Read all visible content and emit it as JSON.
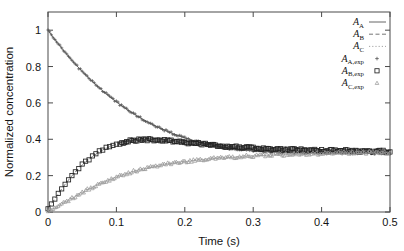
{
  "chart_data": {
    "type": "line",
    "title": "",
    "xlabel": "Time (s)",
    "ylabel": "Normalized concentration",
    "xlim": [
      0,
      0.5
    ],
    "ylim": [
      0,
      1.1
    ],
    "xticks": [
      "0",
      "0.1",
      "0.2",
      "0.3",
      "0.4",
      "0.5"
    ],
    "xtick_values": [
      0,
      0.1,
      0.2,
      0.3,
      0.4,
      0.5
    ],
    "yticks": [
      "0",
      "0.2",
      "0.4",
      "0.6",
      "0.8",
      "1"
    ],
    "ytick_values": [
      0,
      0.2,
      0.4,
      0.6,
      0.8,
      1.0
    ],
    "grid": false,
    "legend_position": "top-right",
    "x": [
      0.0,
      0.005,
      0.01,
      0.015,
      0.02,
      0.025,
      0.03,
      0.035,
      0.04,
      0.045,
      0.05,
      0.055,
      0.06,
      0.065,
      0.07,
      0.075,
      0.08,
      0.085,
      0.09,
      0.095,
      0.1,
      0.105,
      0.11,
      0.115,
      0.12,
      0.125,
      0.13,
      0.135,
      0.14,
      0.145,
      0.15,
      0.155,
      0.16,
      0.165,
      0.17,
      0.175,
      0.18,
      0.185,
      0.19,
      0.195,
      0.2,
      0.205,
      0.21,
      0.215,
      0.22,
      0.225,
      0.23,
      0.235,
      0.24,
      0.245,
      0.25,
      0.255,
      0.26,
      0.265,
      0.27,
      0.275,
      0.28,
      0.285,
      0.29,
      0.295,
      0.3,
      0.305,
      0.31,
      0.315,
      0.32,
      0.325,
      0.33,
      0.335,
      0.34,
      0.345,
      0.35,
      0.355,
      0.36,
      0.365,
      0.37,
      0.375,
      0.38,
      0.385,
      0.39,
      0.395,
      0.4,
      0.405,
      0.41,
      0.415,
      0.42,
      0.425,
      0.43,
      0.435,
      0.44,
      0.445,
      0.45,
      0.455,
      0.46,
      0.465,
      0.47,
      0.475,
      0.48,
      0.485,
      0.49,
      0.495,
      0.5
    ],
    "series": [
      {
        "name": "A_A",
        "label": "A",
        "subscript": "A",
        "style": "solid",
        "marker": "none",
        "color": "#555555",
        "values": [
          1.0,
          0.974,
          0.949,
          0.925,
          0.901,
          0.878,
          0.856,
          0.834,
          0.813,
          0.793,
          0.773,
          0.754,
          0.735,
          0.717,
          0.7,
          0.683,
          0.666,
          0.65,
          0.635,
          0.62,
          0.606,
          0.592,
          0.578,
          0.565,
          0.553,
          0.541,
          0.529,
          0.518,
          0.507,
          0.497,
          0.487,
          0.477,
          0.468,
          0.459,
          0.451,
          0.443,
          0.435,
          0.428,
          0.421,
          0.414,
          0.408,
          0.402,
          0.396,
          0.391,
          0.386,
          0.381,
          0.376,
          0.372,
          0.368,
          0.364,
          0.36,
          0.357,
          0.354,
          0.351,
          0.348,
          0.346,
          0.344,
          0.342,
          0.34,
          0.338,
          0.336,
          0.335,
          0.334,
          0.333,
          0.332,
          0.331,
          0.33,
          0.329,
          0.328,
          0.328,
          0.327,
          0.327,
          0.326,
          0.326,
          0.326,
          0.325,
          0.325,
          0.325,
          0.325,
          0.325,
          0.325,
          0.325,
          0.324,
          0.324,
          0.324,
          0.324,
          0.324,
          0.324,
          0.324,
          0.324,
          0.324,
          0.324,
          0.324,
          0.324,
          0.324,
          0.324,
          0.324,
          0.324,
          0.324,
          0.324,
          0.324
        ]
      },
      {
        "name": "A_B",
        "label": "A",
        "subscript": "B",
        "style": "dashed",
        "marker": "none",
        "color": "#666666",
        "values": [
          0.02,
          0.045,
          0.072,
          0.1,
          0.127,
          0.152,
          0.176,
          0.199,
          0.22,
          0.24,
          0.258,
          0.275,
          0.291,
          0.305,
          0.318,
          0.33,
          0.341,
          0.35,
          0.359,
          0.366,
          0.373,
          0.379,
          0.384,
          0.388,
          0.391,
          0.394,
          0.396,
          0.397,
          0.398,
          0.399,
          0.399,
          0.398,
          0.397,
          0.396,
          0.395,
          0.393,
          0.391,
          0.389,
          0.387,
          0.385,
          0.383,
          0.381,
          0.379,
          0.377,
          0.375,
          0.373,
          0.371,
          0.369,
          0.368,
          0.366,
          0.364,
          0.363,
          0.361,
          0.36,
          0.358,
          0.357,
          0.356,
          0.355,
          0.353,
          0.352,
          0.351,
          0.35,
          0.349,
          0.348,
          0.347,
          0.347,
          0.346,
          0.345,
          0.344,
          0.344,
          0.343,
          0.343,
          0.342,
          0.341,
          0.341,
          0.34,
          0.34,
          0.339,
          0.339,
          0.339,
          0.338,
          0.338,
          0.337,
          0.337,
          0.337,
          0.336,
          0.336,
          0.336,
          0.335,
          0.335,
          0.335,
          0.335,
          0.334,
          0.334,
          0.334,
          0.334,
          0.334,
          0.333,
          0.333,
          0.333,
          0.333
        ]
      },
      {
        "name": "A_C",
        "label": "A",
        "subscript": "C",
        "style": "dotted",
        "marker": "none",
        "color": "#999999",
        "values": [
          0.004,
          0.012,
          0.022,
          0.032,
          0.043,
          0.054,
          0.065,
          0.076,
          0.087,
          0.098,
          0.108,
          0.118,
          0.128,
          0.137,
          0.146,
          0.155,
          0.163,
          0.171,
          0.179,
          0.186,
          0.193,
          0.2,
          0.206,
          0.212,
          0.218,
          0.223,
          0.229,
          0.234,
          0.238,
          0.243,
          0.247,
          0.251,
          0.255,
          0.258,
          0.262,
          0.265,
          0.268,
          0.271,
          0.273,
          0.276,
          0.278,
          0.281,
          0.283,
          0.285,
          0.287,
          0.289,
          0.29,
          0.292,
          0.294,
          0.295,
          0.297,
          0.298,
          0.3,
          0.301,
          0.302,
          0.303,
          0.304,
          0.306,
          0.307,
          0.308,
          0.309,
          0.31,
          0.311,
          0.311,
          0.312,
          0.313,
          0.314,
          0.315,
          0.315,
          0.316,
          0.317,
          0.317,
          0.318,
          0.319,
          0.319,
          0.32,
          0.32,
          0.321,
          0.321,
          0.322,
          0.322,
          0.323,
          0.323,
          0.324,
          0.324,
          0.324,
          0.325,
          0.325,
          0.326,
          0.326,
          0.326,
          0.327,
          0.327,
          0.327,
          0.328,
          0.328,
          0.328,
          0.329,
          0.329,
          0.329,
          0.33
        ]
      }
    ],
    "experimental_series": [
      {
        "name": "A_A,exp",
        "label": "A",
        "subscript": "A,exp",
        "marker": "plus",
        "color": "#555555",
        "follows": "A_A",
        "noise": 0.006
      },
      {
        "name": "A_B,exp",
        "label": "A",
        "subscript": "B,exp",
        "marker": "square",
        "color": "#222222",
        "follows": "A_B",
        "noise": 0.007
      },
      {
        "name": "A_C,exp",
        "label": "A",
        "subscript": "C,exp",
        "marker": "triangle",
        "color": "#9a9a9a",
        "follows": "A_C",
        "noise": 0.008
      }
    ]
  }
}
